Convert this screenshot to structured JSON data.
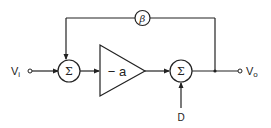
{
  "diagram": {
    "input": {
      "label": "V",
      "subscript": "i"
    },
    "output": {
      "label": "V",
      "subscript": "o"
    },
    "feedback_block": {
      "label": "β"
    },
    "amplifier": {
      "label": "− a"
    },
    "summer_input": {
      "label": "Σ"
    },
    "summer_output": {
      "label": "Σ"
    },
    "disturbance": {
      "label": "D"
    },
    "connections": [
      {
        "from": "input",
        "to": "summer_input"
      },
      {
        "from": "summer_input",
        "to": "amplifier"
      },
      {
        "from": "amplifier",
        "to": "summer_output"
      },
      {
        "from": "disturbance",
        "to": "summer_output"
      },
      {
        "from": "summer_output",
        "to": "output"
      },
      {
        "from": "output",
        "to": "feedback_block"
      },
      {
        "from": "feedback_block",
        "to": "summer_input"
      }
    ]
  }
}
